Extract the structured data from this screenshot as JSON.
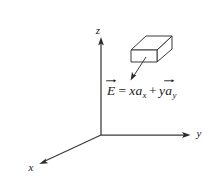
{
  "figure": {
    "background_color": "#ffffff",
    "stroke_color": "#3a3a3a",
    "text_color": "#1a1a1a",
    "width": 214,
    "height": 189
  },
  "axes": {
    "origin": {
      "x": 101,
      "y": 135
    },
    "x_axis": {
      "label": "x",
      "label_x": 30,
      "label_y": 171,
      "tip": {
        "x": 40,
        "y": 164
      }
    },
    "y_axis": {
      "label": "y",
      "label_x": 196,
      "label_y": 136,
      "tip": {
        "x": 190,
        "y": 135
      }
    },
    "z_axis": {
      "label": "z",
      "label_x": 98,
      "label_y": 34,
      "tip": {
        "x": 101,
        "y": 37
      }
    }
  },
  "box": {
    "name": "rectangular-volume",
    "top_face": [
      [
        131,
        50
      ],
      [
        146,
        36
      ],
      [
        172,
        36
      ],
      [
        157,
        50
      ]
    ],
    "front_face": [
      [
        131,
        50
      ],
      [
        157,
        50
      ],
      [
        157,
        62
      ],
      [
        131,
        62
      ]
    ],
    "right_face": [
      [
        157,
        50
      ],
      [
        172,
        36
      ],
      [
        172,
        49
      ],
      [
        157,
        62
      ]
    ]
  },
  "pointer": {
    "name": "field-pointer-arrow",
    "from": {
      "x": 146,
      "y": 57
    },
    "to": {
      "x": 131,
      "y": 80
    }
  },
  "equation": {
    "full_text": "E⃗ = x a_x + y a⃗_y",
    "lhs_symbol": "E",
    "equals": "=",
    "term1_coefficient": "x",
    "term1_unit_vector": "a",
    "term1_subscript": "x",
    "plus": "+",
    "term2_coefficient": "y",
    "term2_unit_vector": "a",
    "term2_subscript": "y"
  }
}
